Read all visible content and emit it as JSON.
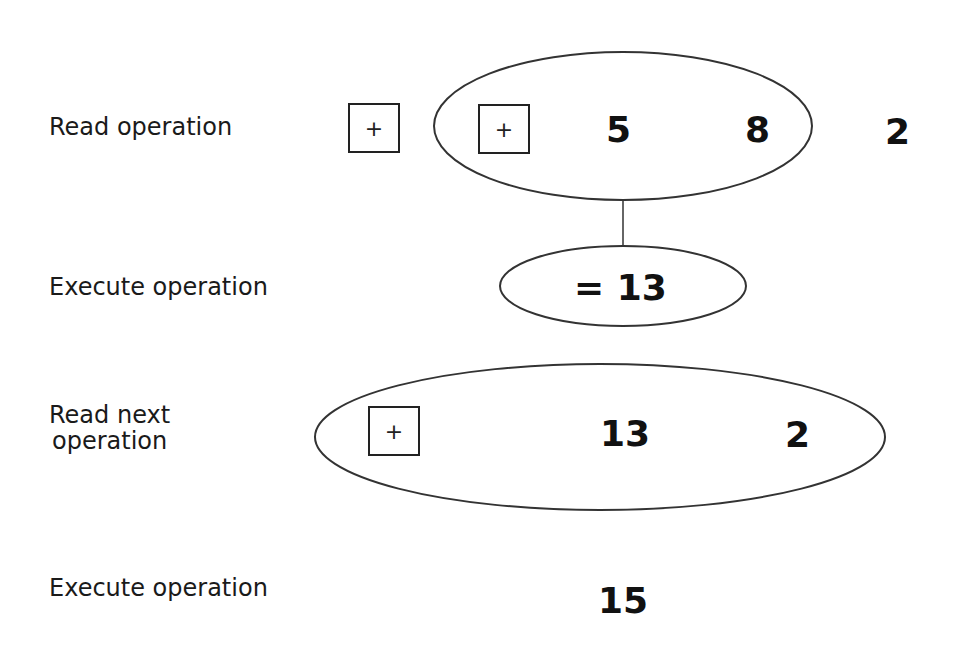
{
  "steps": [
    {
      "label": "Read operation"
    },
    {
      "label": "Execute operation"
    },
    {
      "label": "Read next\noperation",
      "label_line1": "Read next",
      "label_line2": "operation"
    },
    {
      "label": "Execute operation"
    }
  ],
  "row1": {
    "outer_operator": "+",
    "inner_operator": "+",
    "operand_a": "5",
    "operand_b": "8",
    "remaining": "2"
  },
  "row2": {
    "result": "= 13"
  },
  "row3": {
    "operator": "+",
    "operand_a": "13",
    "operand_b": "2"
  },
  "row4": {
    "result": "15"
  },
  "colors": {
    "stroke": "#333333",
    "text": "#111111",
    "background": "#ffffff"
  }
}
